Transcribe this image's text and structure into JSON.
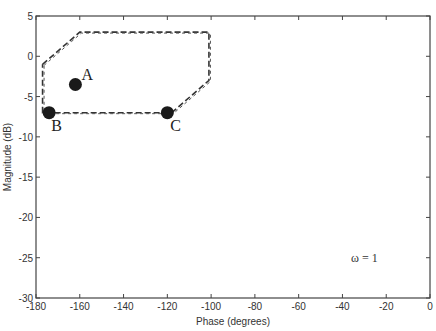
{
  "chart_data": {
    "type": "line",
    "title": "",
    "xlabel": "Phase (degrees)",
    "ylabel": "Magnitude (dB)",
    "xlim": [
      -180,
      0
    ],
    "ylim": [
      -30,
      5
    ],
    "xticks": [
      -180,
      -160,
      -140,
      -120,
      -100,
      -80,
      -60,
      -40,
      -20,
      0
    ],
    "yticks": [
      5,
      0,
      -5,
      -10,
      -15,
      -20,
      -25,
      -30
    ],
    "grid": false,
    "series": [
      {
        "name": "template boundary",
        "style": "dashed",
        "x": [
          -177,
          -160,
          -101,
          -101,
          -118,
          -177,
          -177
        ],
        "y": [
          -1,
          3,
          3,
          -3,
          -7,
          -7,
          -1
        ]
      }
    ],
    "points": [
      {
        "label": "A",
        "x": -162,
        "y": -3.5
      },
      {
        "label": "B",
        "x": -174,
        "y": -7
      },
      {
        "label": "C",
        "x": -120,
        "y": -7
      }
    ],
    "annotations": [
      {
        "text": "ω = 1",
        "x": -30,
        "y": -25
      }
    ]
  }
}
